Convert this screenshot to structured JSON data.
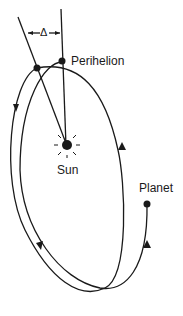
{
  "diagram": {
    "labels": {
      "delta": "Δ",
      "perihelion": "Perihelion",
      "sun": "Sun",
      "planet": "Planet"
    },
    "colors": {
      "ink": "#1a1a1a",
      "background": "#ffffff"
    }
  }
}
